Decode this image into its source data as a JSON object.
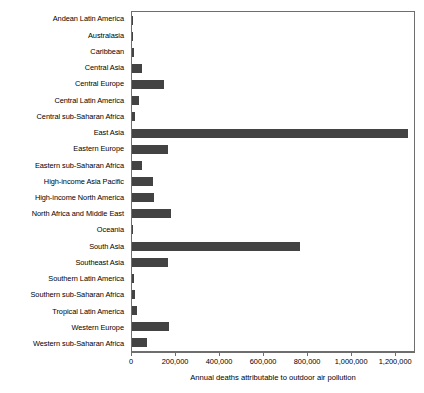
{
  "chart_data": {
    "type": "bar",
    "orientation": "horizontal",
    "title": "",
    "xlabel": "Annual deaths attributable to outdoor air pollution",
    "ylabel": "",
    "xlim": [
      0,
      1290000
    ],
    "xticks": [
      0,
      200000,
      400000,
      600000,
      800000,
      1000000,
      1200000
    ],
    "xtick_labels": [
      "0",
      "200,000",
      "400,000",
      "600,000",
      "800,000",
      "1,000,000",
      "1,200,000"
    ],
    "grid": false,
    "legend": null,
    "bar_color": "#434343",
    "axis_color": "#6e6e6e",
    "categories": [
      "Andean Latin America",
      "Australasia",
      "Caribbean",
      "Central Asia",
      "Central Europe",
      "Central Latin America",
      "Central sub-Saharan Africa",
      "East Asia",
      "Eastern Europe",
      "Eastern sub-Saharan Africa",
      "High-income Asia Pacific",
      "High-income North America",
      "North Africa and Middle East",
      "Oceania",
      "South Asia",
      "Southeast Asia",
      "Southern Latin America",
      "Southern sub-Saharan Africa",
      "Tropical Latin America",
      "Western Europe",
      "Western sub-Saharan Africa"
    ],
    "values": [
      6000,
      2000,
      9000,
      47000,
      145000,
      34000,
      14000,
      1255000,
      165000,
      47000,
      95000,
      102000,
      175000,
      1000,
      765000,
      165000,
      11000,
      12000,
      22000,
      167000,
      70000
    ]
  }
}
